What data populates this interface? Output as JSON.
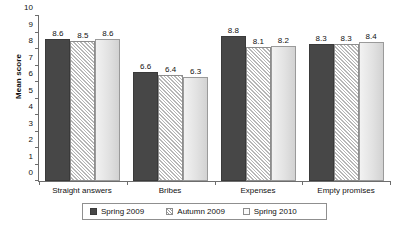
{
  "chart_data": {
    "type": "bar",
    "title": "",
    "xlabel": "",
    "ylabel": "Mean score",
    "ylim": [
      0,
      10
    ],
    "yticks": [
      0,
      1,
      2,
      3,
      4,
      5,
      6,
      7,
      8,
      9,
      10
    ],
    "grid": false,
    "legend_position": "bottom",
    "categories": [
      "Straight answers",
      "Bribes",
      "Expenses",
      "Empty promises"
    ],
    "series": [
      {
        "name": "Spring 2009",
        "values": [
          8.6,
          6.6,
          8.8,
          8.3
        ],
        "style": "solid-dark",
        "color": "#474747"
      },
      {
        "name": "Autumn 2009",
        "values": [
          8.5,
          6.4,
          8.1,
          8.3
        ],
        "style": "diagonal-hatch",
        "color": "#ffffff"
      },
      {
        "name": "Spring 2010",
        "values": [
          8.6,
          6.3,
          8.2,
          8.4
        ],
        "style": "light-gradient",
        "color": "#e2e2e2"
      }
    ]
  },
  "axis": {
    "y_title": "Mean score"
  }
}
